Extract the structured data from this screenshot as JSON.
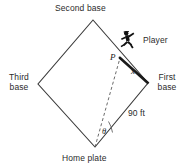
{
  "figure": {
    "type": "geometry-diagram",
    "background_color": "#ffffff",
    "line_color": "#3a3a3a",
    "text_color": "#2b2b2b"
  },
  "labels": {
    "second_base": "Second base",
    "third_base": "Third base",
    "first_base": "First base",
    "home_plate": "Home plate",
    "player": "Player",
    "distance_base_path": "90 ft",
    "point_p": "P",
    "segment_x": "x",
    "angle_theta": "θ"
  },
  "icons": {
    "runner": "running-player-icon"
  },
  "geometry": {
    "vertices": {
      "second_base": [
        93,
        20
      ],
      "third_base": [
        38,
        84
      ],
      "first_base": [
        148,
        83
      ],
      "home_plate": [
        95,
        147
      ]
    },
    "point_p": [
      120,
      58
    ],
    "dashed_line": [
      [
        95,
        147
      ],
      [
        120,
        58
      ]
    ],
    "thick_segment": [
      [
        120,
        58
      ],
      [
        148,
        83
      ]
    ],
    "angle_arc_vertex": [
      95,
      147
    ],
    "base_path_length_ft": 90
  }
}
